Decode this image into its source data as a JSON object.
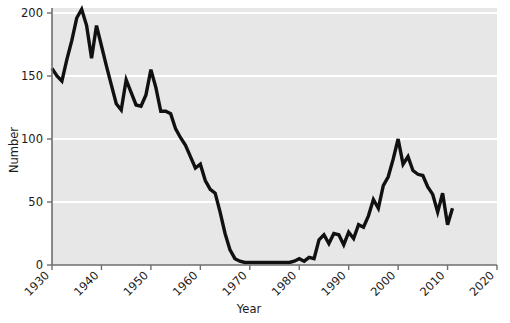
{
  "chart_data": {
    "type": "line",
    "title": "",
    "xlabel": "Year",
    "ylabel": "Number",
    "xlim": [
      1930,
      2020
    ],
    "ylim": [
      0,
      200
    ],
    "grid": true,
    "legend": null,
    "x_ticks": [
      "1930",
      "1940",
      "1950",
      "1960",
      "1970",
      "1980",
      "1990",
      "2000",
      "2010",
      "2020"
    ],
    "x_tick_values": [
      1930,
      1940,
      1950,
      1960,
      1970,
      1980,
      1990,
      2000,
      2010,
      2020
    ],
    "y_ticks": [
      "0",
      "50",
      "100",
      "150",
      "200"
    ],
    "y_tick_values": [
      0,
      50,
      100,
      150,
      200
    ],
    "series": [
      {
        "name": "Number",
        "color": "#111111",
        "x": [
          1930,
          1931,
          1932,
          1933,
          1934,
          1935,
          1936,
          1937,
          1938,
          1939,
          1940,
          1941,
          1942,
          1943,
          1944,
          1945,
          1946,
          1947,
          1948,
          1949,
          1950,
          1951,
          1952,
          1953,
          1954,
          1955,
          1956,
          1957,
          1958,
          1959,
          1960,
          1961,
          1962,
          1963,
          1964,
          1965,
          1966,
          1967,
          1968,
          1969,
          1970,
          1971,
          1972,
          1973,
          1974,
          1975,
          1976,
          1977,
          1978,
          1979,
          1980,
          1981,
          1982,
          1983,
          1984,
          1985,
          1986,
          1987,
          1988,
          1989,
          1990,
          1991,
          1992,
          1993,
          1994,
          1995,
          1996,
          1997,
          1998,
          1999,
          2000,
          2001,
          2002,
          2003,
          2004,
          2005,
          2006,
          2007,
          2008,
          2009,
          2010,
          2011
        ],
        "y": [
          156,
          150,
          146,
          163,
          178,
          196,
          203,
          190,
          164,
          190,
          174,
          158,
          143,
          128,
          123,
          147,
          137,
          127,
          126,
          135,
          155,
          141,
          122,
          122,
          120,
          108,
          101,
          95,
          86,
          77,
          80,
          67,
          60,
          57,
          42,
          25,
          12,
          5,
          3,
          2,
          2,
          2,
          2,
          2,
          2,
          2,
          2,
          2,
          2,
          3,
          5,
          3,
          6,
          5,
          20,
          24,
          17,
          25,
          24,
          16,
          26,
          21,
          32,
          30,
          39,
          52,
          45,
          63,
          70,
          84,
          100,
          80,
          86,
          75,
          72,
          71,
          62,
          56,
          42,
          57,
          32,
          45
        ]
      }
    ]
  },
  "axes": {
    "ylabel": "Number",
    "xlabel": "Year"
  }
}
